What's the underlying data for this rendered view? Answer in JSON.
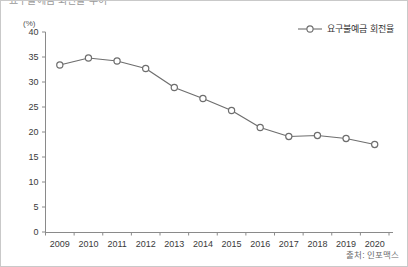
{
  "figure": {
    "title_clipped": "요구불예금 회전율 추이",
    "unit_label": "(%)",
    "source_note": "출처: 인포맥스",
    "border_color": "#c9c9c9",
    "background": "#ffffff"
  },
  "legend": {
    "position": "top-right",
    "entries": [
      {
        "label": "요구불예금 회전율",
        "color": "#6e6e6e",
        "marker": "open-circle"
      }
    ]
  },
  "chart_data": {
    "type": "line",
    "title": "요구불예금 회전율 추이",
    "xlabel": "",
    "ylabel": "",
    "unit": "(%)",
    "categories": [
      "2009",
      "2010",
      "2011",
      "2012",
      "2013",
      "2014",
      "2015",
      "2016",
      "2017",
      "2018",
      "2019",
      "2020"
    ],
    "series": [
      {
        "name": "요구불예금 회전율",
        "color": "#6e6e6e",
        "marker": "open-circle",
        "values": [
          33.4,
          34.8,
          34.2,
          32.7,
          28.9,
          26.7,
          24.3,
          20.9,
          19.1,
          19.3,
          18.7,
          17.5
        ]
      }
    ],
    "ylim": [
      0,
      40
    ],
    "yticks": [
      0,
      5,
      10,
      15,
      20,
      25,
      30,
      35,
      40
    ],
    "ytick_labels": [
      "0",
      "5",
      "10",
      "15",
      "20",
      "25",
      "30",
      "35",
      "40"
    ],
    "xtick_labels": [
      "2009",
      "2010",
      "2011",
      "2012",
      "2013",
      "2014",
      "2015",
      "2016",
      "2017",
      "2018",
      "2019",
      "2020"
    ],
    "grid": false,
    "legend_position": "top-right"
  }
}
